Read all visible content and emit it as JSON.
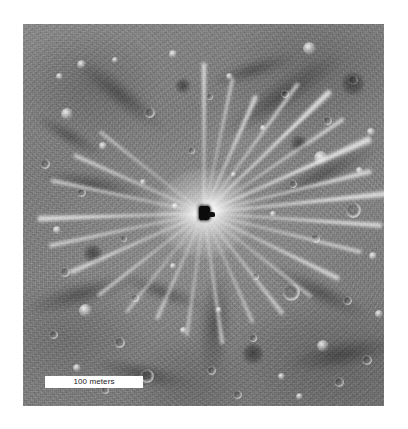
{
  "figure": {
    "kind": "planetary-surface-photograph",
    "frame": {
      "left": 23,
      "top": 24,
      "width": 361,
      "height": 382,
      "background_color": "#ffffff",
      "surface_color": "#7e7e7e"
    }
  },
  "scale_bar": {
    "label": "100 meters",
    "value": 100,
    "unit": "meters",
    "bar_color": "#ffffff",
    "text_color": "#1a1a1a",
    "position": "bottom-left",
    "left": 45,
    "top": 376,
    "width": 98,
    "height": 12
  },
  "crater": {
    "name": "central-impact-crater",
    "center_x": 204,
    "center_y": 213,
    "core_color": "#0a0a0a",
    "halo_color": "#ffffff",
    "ray_count": 26
  },
  "rays": [
    {
      "angle": -90,
      "length": 150,
      "width": 5,
      "opacity": 0.5
    },
    {
      "angle": -78,
      "length": 138,
      "width": 4,
      "opacity": 0.4
    },
    {
      "angle": -66,
      "length": 128,
      "width": 6,
      "opacity": 0.46
    },
    {
      "angle": -54,
      "length": 160,
      "width": 5,
      "opacity": 0.44
    },
    {
      "angle": -44,
      "length": 175,
      "width": 7,
      "opacity": 0.52
    },
    {
      "angle": -34,
      "length": 168,
      "width": 5,
      "opacity": 0.42
    },
    {
      "angle": -24,
      "length": 182,
      "width": 8,
      "opacity": 0.5
    },
    {
      "angle": -14,
      "length": 172,
      "width": 6,
      "opacity": 0.44
    },
    {
      "angle": -6,
      "length": 186,
      "width": 7,
      "opacity": 0.48
    },
    {
      "angle": 4,
      "length": 178,
      "width": 6,
      "opacity": 0.45
    },
    {
      "angle": 14,
      "length": 162,
      "width": 5,
      "opacity": 0.4
    },
    {
      "angle": 26,
      "length": 150,
      "width": 6,
      "opacity": 0.42
    },
    {
      "angle": 38,
      "length": 136,
      "width": 4,
      "opacity": 0.36
    },
    {
      "angle": 52,
      "length": 128,
      "width": 5,
      "opacity": 0.38
    },
    {
      "angle": 66,
      "length": 120,
      "width": 4,
      "opacity": 0.34
    },
    {
      "angle": 82,
      "length": 132,
      "width": 5,
      "opacity": 0.38
    },
    {
      "angle": 98,
      "length": 124,
      "width": 4,
      "opacity": 0.34
    },
    {
      "angle": 114,
      "length": 116,
      "width": 5,
      "opacity": 0.34
    },
    {
      "angle": 128,
      "length": 126,
      "width": 4,
      "opacity": 0.32
    },
    {
      "angle": 142,
      "length": 134,
      "width": 5,
      "opacity": 0.36
    },
    {
      "angle": 156,
      "length": 146,
      "width": 6,
      "opacity": 0.4
    },
    {
      "angle": 168,
      "length": 158,
      "width": 5,
      "opacity": 0.42
    },
    {
      "angle": 178,
      "length": 166,
      "width": 7,
      "opacity": 0.46
    },
    {
      "angle": 192,
      "length": 156,
      "width": 5,
      "opacity": 0.4
    },
    {
      "angle": 204,
      "length": 142,
      "width": 5,
      "opacity": 0.38
    },
    {
      "angle": 218,
      "length": 132,
      "width": 4,
      "opacity": 0.34
    }
  ],
  "dark_lanes": [
    {
      "cx": 96,
      "cy": 70,
      "w": 120,
      "h": 26,
      "angle": 38
    },
    {
      "cx": 258,
      "cy": 72,
      "w": 150,
      "h": 30,
      "angle": -34
    },
    {
      "cx": 300,
      "cy": 150,
      "w": 130,
      "h": 24,
      "angle": -26
    },
    {
      "cx": 70,
      "cy": 160,
      "w": 110,
      "h": 22,
      "angle": 10
    },
    {
      "cx": 58,
      "cy": 270,
      "w": 120,
      "h": 26,
      "angle": -16
    },
    {
      "cx": 140,
      "cy": 268,
      "w": 90,
      "h": 20,
      "angle": 20
    },
    {
      "cx": 192,
      "cy": 300,
      "w": 34,
      "h": 110,
      "angle": 4
    },
    {
      "cx": 296,
      "cy": 268,
      "w": 110,
      "h": 24,
      "angle": 26
    },
    {
      "cx": 320,
      "cy": 330,
      "w": 120,
      "h": 30,
      "angle": -10
    },
    {
      "cx": 120,
      "cy": 350,
      "w": 100,
      "h": 24,
      "angle": 12
    },
    {
      "cx": 230,
      "cy": 46,
      "w": 90,
      "h": 20,
      "angle": -18
    },
    {
      "cx": 46,
      "cy": 112,
      "w": 80,
      "h": 18,
      "angle": 30
    }
  ],
  "craters": [
    {
      "x": 286,
      "y": 24,
      "d": 13,
      "type": "bright"
    },
    {
      "x": 58,
      "y": 40,
      "d": 9,
      "type": "bright"
    },
    {
      "x": 150,
      "y": 30,
      "d": 8,
      "type": "bright"
    },
    {
      "x": 206,
      "y": 52,
      "d": 7,
      "type": "bright"
    },
    {
      "x": 330,
      "y": 56,
      "d": 10,
      "type": "ring"
    },
    {
      "x": 36,
      "y": 52,
      "d": 7,
      "type": "bright"
    },
    {
      "x": 92,
      "y": 36,
      "d": 6,
      "type": "bright"
    },
    {
      "x": 262,
      "y": 70,
      "d": 8,
      "type": "ring"
    },
    {
      "x": 126,
      "y": 88,
      "d": 11,
      "type": "ring"
    },
    {
      "x": 44,
      "y": 90,
      "d": 12,
      "type": "bright"
    },
    {
      "x": 186,
      "y": 72,
      "d": 7,
      "type": "ring"
    },
    {
      "x": 304,
      "y": 96,
      "d": 9,
      "type": "ring"
    },
    {
      "x": 348,
      "y": 108,
      "d": 8,
      "type": "bright"
    },
    {
      "x": 240,
      "y": 104,
      "d": 6,
      "type": "bright"
    },
    {
      "x": 80,
      "y": 122,
      "d": 8,
      "type": "bright"
    },
    {
      "x": 22,
      "y": 140,
      "d": 10,
      "type": "ring"
    },
    {
      "x": 168,
      "y": 126,
      "d": 7,
      "type": "ring"
    },
    {
      "x": 298,
      "y": 134,
      "d": 14,
      "type": "bright"
    },
    {
      "x": 336,
      "y": 146,
      "d": 7,
      "type": "bright"
    },
    {
      "x": 58,
      "y": 168,
      "d": 9,
      "type": "ring"
    },
    {
      "x": 120,
      "y": 158,
      "d": 6,
      "type": "bright"
    },
    {
      "x": 270,
      "y": 160,
      "d": 8,
      "type": "ring"
    },
    {
      "x": 330,
      "y": 186,
      "d": 16,
      "type": "ring"
    },
    {
      "x": 34,
      "y": 206,
      "d": 8,
      "type": "bright"
    },
    {
      "x": 100,
      "y": 214,
      "d": 7,
      "type": "ring"
    },
    {
      "x": 292,
      "y": 214,
      "d": 9,
      "type": "ring"
    },
    {
      "x": 350,
      "y": 232,
      "d": 8,
      "type": "bright"
    },
    {
      "x": 42,
      "y": 248,
      "d": 10,
      "type": "ring"
    },
    {
      "x": 150,
      "y": 242,
      "d": 6,
      "type": "bright"
    },
    {
      "x": 232,
      "y": 252,
      "d": 7,
      "type": "ring"
    },
    {
      "x": 62,
      "y": 286,
      "d": 13,
      "type": "bright"
    },
    {
      "x": 112,
      "y": 274,
      "d": 8,
      "type": "ring"
    },
    {
      "x": 196,
      "y": 286,
      "d": 6,
      "type": "bright"
    },
    {
      "x": 268,
      "y": 268,
      "d": 18,
      "type": "ring"
    },
    {
      "x": 324,
      "y": 276,
      "d": 9,
      "type": "ring"
    },
    {
      "x": 356,
      "y": 290,
      "d": 8,
      "type": "bright"
    },
    {
      "x": 30,
      "y": 310,
      "d": 9,
      "type": "ring"
    },
    {
      "x": 96,
      "y": 318,
      "d": 11,
      "type": "ring"
    },
    {
      "x": 160,
      "y": 306,
      "d": 7,
      "type": "bright"
    },
    {
      "x": 230,
      "y": 314,
      "d": 8,
      "type": "ring"
    },
    {
      "x": 300,
      "y": 322,
      "d": 12,
      "type": "bright"
    },
    {
      "x": 344,
      "y": 336,
      "d": 10,
      "type": "ring"
    },
    {
      "x": 54,
      "y": 344,
      "d": 8,
      "type": "bright"
    },
    {
      "x": 124,
      "y": 352,
      "d": 14,
      "type": "ring"
    },
    {
      "x": 188,
      "y": 346,
      "d": 9,
      "type": "ring"
    },
    {
      "x": 258,
      "y": 352,
      "d": 7,
      "type": "bright"
    },
    {
      "x": 316,
      "y": 358,
      "d": 10,
      "type": "ring"
    },
    {
      "x": 82,
      "y": 366,
      "d": 8,
      "type": "ring"
    },
    {
      "x": 214,
      "y": 370,
      "d": 9,
      "type": "ring"
    },
    {
      "x": 276,
      "y": 372,
      "d": 7,
      "type": "bright"
    },
    {
      "x": 152,
      "y": 182,
      "d": 6,
      "type": "bright"
    },
    {
      "x": 250,
      "y": 190,
      "d": 6,
      "type": "bright"
    },
    {
      "x": 210,
      "y": 150,
      "d": 5,
      "type": "bright"
    },
    {
      "x": 160,
      "y": 62,
      "d": 14,
      "type": "dark"
    },
    {
      "x": 276,
      "y": 120,
      "d": 16,
      "type": "dark"
    },
    {
      "x": 70,
      "y": 230,
      "d": 18,
      "type": "dark"
    },
    {
      "x": 230,
      "y": 330,
      "d": 20,
      "type": "dark"
    },
    {
      "x": 330,
      "y": 60,
      "d": 22,
      "type": "dark"
    }
  ]
}
